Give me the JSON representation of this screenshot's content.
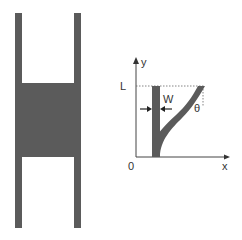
{
  "left_figure": {
    "description": "H-shaped structure",
    "color": "#5a5a5a"
  },
  "right_figure": {
    "axes": {
      "y_label": "y",
      "x_label": "x",
      "origin_label": "0",
      "length_label": "L"
    },
    "width_label": "W",
    "angle_label": "θ",
    "beam_color": "#5a5a5a",
    "axis_color": "#444444"
  }
}
